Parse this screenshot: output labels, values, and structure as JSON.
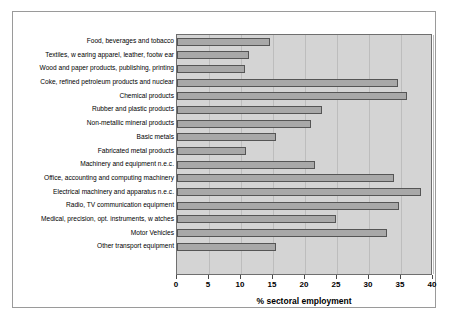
{
  "chart_data": {
    "type": "bar",
    "orientation": "horizontal",
    "title": "",
    "xlabel": "% sectoral employment",
    "ylabel": "",
    "xlim": [
      0,
      40
    ],
    "xticks": [
      0,
      5,
      10,
      15,
      20,
      25,
      30,
      35,
      40
    ],
    "xticklabels": [
      "0",
      "5",
      "10",
      "15",
      "20",
      "25",
      "30",
      "35",
      "40"
    ],
    "grid": "vertical",
    "legend": "none",
    "bar_fill_color": "#a8a8a8",
    "bar_edge_color": "#555555",
    "plot_background_color": "#d4d4d4",
    "categories": [
      "Food, beverages and tobacco",
      "Textiles, w earing apparel, leather, footw ear",
      "Wood and paper products, publishing, printing",
      "Coke, refined petroleum products and nuclear",
      "Chemical products",
      "Rubber and plastic products",
      "Non-metallic mineral products",
      "Basic metals",
      "Fabricated metal products",
      "Machinery and equipment n.e.c.",
      "Office, accounting and computing machinery",
      "Electrical machinery and apparatus n.e.c.",
      "Radio, TV communication equipment",
      "Medical, precision, opt. instruments, w atches",
      "Motor Vehicles",
      "Other transport equipment"
    ],
    "values": [
      14.6,
      11.3,
      10.6,
      34.5,
      36.0,
      22.6,
      21.0,
      15.5,
      10.8,
      21.5,
      33.9,
      38.1,
      34.7,
      24.8,
      32.8,
      15.5
    ]
  }
}
